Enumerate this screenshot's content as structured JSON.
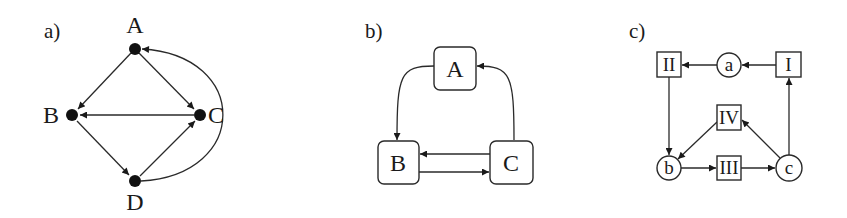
{
  "panels": [
    {
      "id": "a",
      "label": "a)",
      "nodes": [
        {
          "id": "A",
          "label": "A",
          "shape": "dot"
        },
        {
          "id": "B",
          "label": "B",
          "shape": "dot"
        },
        {
          "id": "C",
          "label": "C",
          "shape": "dot"
        },
        {
          "id": "D",
          "label": "D",
          "shape": "dot"
        }
      ],
      "edges": [
        {
          "from": "A",
          "to": "B"
        },
        {
          "from": "A",
          "to": "C"
        },
        {
          "from": "C",
          "to": "B"
        },
        {
          "from": "B",
          "to": "D"
        },
        {
          "from": "D",
          "to": "C"
        },
        {
          "from": "D",
          "to": "A",
          "curved": true
        }
      ]
    },
    {
      "id": "b",
      "label": "b)",
      "nodes": [
        {
          "id": "A",
          "label": "A",
          "shape": "rounded-box"
        },
        {
          "id": "B",
          "label": "B",
          "shape": "rounded-box"
        },
        {
          "id": "C",
          "label": "C",
          "shape": "rounded-box"
        }
      ],
      "edges": [
        {
          "from": "A",
          "to": "B",
          "curved": true
        },
        {
          "from": "C",
          "to": "A",
          "curved": true
        },
        {
          "from": "C",
          "to": "B"
        },
        {
          "from": "B",
          "to": "C"
        }
      ]
    },
    {
      "id": "c",
      "label": "c)",
      "nodes": [
        {
          "id": "II",
          "label": "II",
          "shape": "square"
        },
        {
          "id": "a",
          "label": "a",
          "shape": "circle"
        },
        {
          "id": "I",
          "label": "I",
          "shape": "square"
        },
        {
          "id": "IV",
          "label": "IV",
          "shape": "square"
        },
        {
          "id": "b",
          "label": "b",
          "shape": "circle"
        },
        {
          "id": "III",
          "label": "III",
          "shape": "square"
        },
        {
          "id": "c",
          "label": "c",
          "shape": "circle"
        }
      ],
      "edges": [
        {
          "from": "I",
          "to": "a"
        },
        {
          "from": "a",
          "to": "II"
        },
        {
          "from": "II",
          "to": "b"
        },
        {
          "from": "IV",
          "to": "b"
        },
        {
          "from": "b",
          "to": "III"
        },
        {
          "from": "III",
          "to": "c"
        },
        {
          "from": "c",
          "to": "IV"
        },
        {
          "from": "c",
          "to": "I"
        }
      ]
    }
  ]
}
